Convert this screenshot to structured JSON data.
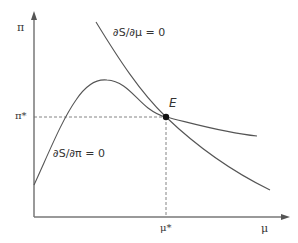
{
  "diagram": {
    "axes": {
      "y_label": "π",
      "x_label": "μ",
      "y_tick_label": "π*",
      "x_tick_label": "μ*"
    },
    "curves": [
      {
        "name": "ds-dmu-curve",
        "label": "∂S/∂μ = 0"
      },
      {
        "name": "ds-dpi-curve",
        "label": "∂S/∂π = 0"
      }
    ],
    "equilibrium": {
      "label": "E"
    },
    "colors": {
      "axis": "#777777",
      "curve": "#555555",
      "point": "#111111",
      "text": "#333333"
    }
  }
}
